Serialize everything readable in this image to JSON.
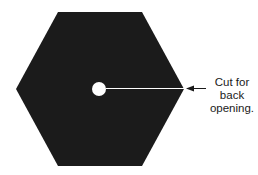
{
  "diagram": {
    "shape": "hexagon",
    "fill_color": "#1b1b1b",
    "background_color": "#ffffff",
    "hexagon_points": "58,12 142,12 184,89 142,166 58,166 16,89",
    "center_hole": {
      "cx": 99,
      "cy": 89,
      "r": 7,
      "color": "#ffffff"
    },
    "cut_line": {
      "x1": 106,
      "y1": 88.5,
      "x2": 184,
      "y2": 88.5,
      "color": "#ffffff"
    },
    "callout": {
      "arrow_color": "#1a1a1a",
      "lines": [
        "Cut for",
        "back",
        "opening."
      ]
    }
  }
}
